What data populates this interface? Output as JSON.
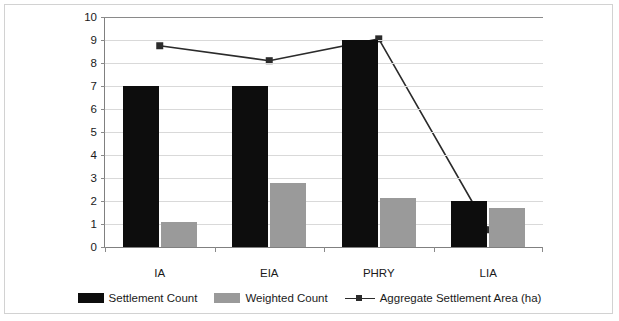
{
  "chart_data": {
    "type": "bar",
    "title": "",
    "xlabel": "",
    "ylabel": "",
    "ylim": [
      0,
      10
    ],
    "ytick_step": 1,
    "yticks": [
      "10",
      "9",
      "8",
      "7",
      "6",
      "5",
      "4",
      "3",
      "2",
      "1",
      "0"
    ],
    "grid": true,
    "legend_position": "bottom",
    "categories": [
      "IA",
      "EIA",
      "PHRY",
      "LIA"
    ],
    "series": [
      {
        "name": "Settlement Count",
        "type": "bar",
        "color": "#0d0d0d",
        "values": [
          7,
          7,
          9,
          2
        ]
      },
      {
        "name": "Weighted Count",
        "type": "bar",
        "color": "#9a9a9a",
        "values": [
          1.1,
          2.8,
          2.15,
          1.7
        ]
      },
      {
        "name": "Aggregate Settlement Area (ha)",
        "type": "line",
        "color": "#2b2b2b",
        "marker": "square",
        "values": [
          8.75,
          8.1,
          9.05,
          0.75
        ]
      }
    ]
  },
  "legend": {
    "items": [
      {
        "label": "Settlement Count",
        "marker": "black-square-swatch"
      },
      {
        "label": "Weighted Count",
        "marker": "gray-square-swatch"
      },
      {
        "label": "Aggregate Settlement Area (ha)",
        "marker": "line-with-square-marker"
      }
    ]
  }
}
